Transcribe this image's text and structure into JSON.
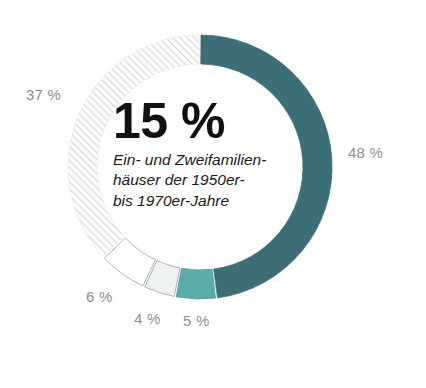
{
  "chart_data": {
    "type": "pie",
    "variant": "donut",
    "title": "",
    "subtitle": "",
    "xlabel": "",
    "ylabel": "",
    "unit": "%",
    "total": 100,
    "start_angle_deg": 0,
    "direction": "clockwise",
    "legend": "none",
    "grid": false,
    "center_value": "15 %",
    "center_caption_lines": [
      "Ein- und Zweifamilien-",
      "häuser der 1950er-",
      "bis 1970er-Jahre"
    ],
    "categories": [
      "48 %",
      "5 %",
      "4 %",
      "6 %",
      "37 %"
    ],
    "values": [
      48,
      5,
      4,
      6,
      37
    ],
    "labels": [
      "48 %",
      "5 %",
      "4 %",
      "6 %",
      "37 %"
    ],
    "slices": [
      {
        "label": "48 %",
        "value": 48,
        "color": "#3d6e75",
        "fill": "solid",
        "stroke": "#3d6e75"
      },
      {
        "label": "5 %",
        "value": 5,
        "color": "#5aada8",
        "fill": "solid",
        "stroke": "#4f9b97"
      },
      {
        "label": "4 %",
        "value": 4,
        "color": "#eef3f2",
        "fill": "solid",
        "stroke": "#9aa3a3"
      },
      {
        "label": "6 %",
        "value": 6,
        "color": "#ffffff",
        "fill": "solid",
        "stroke": "#9aa3a3"
      },
      {
        "label": "37 %",
        "value": 37,
        "color": "#d8dcdc",
        "fill": "hatch",
        "stroke": "#e2e6e6"
      }
    ]
  },
  "colors": {
    "primary_dark_teal": "#3d6e75",
    "accent_teal": "#5aada8",
    "off_white": "#eef3f2",
    "white": "#ffffff",
    "hatch_gray": "#d8dcdc",
    "label_gray": "#8e8e8e",
    "center_text": "#111111",
    "background": "#ffffff"
  },
  "center": {
    "value": "15 %",
    "line1": "Ein- und Zweifamilien-",
    "line2": "häuser der 1950er-",
    "line3": "bis 1970er-Jahre"
  },
  "labels": {
    "pct_37": "37 %",
    "pct_48": "48 %",
    "pct_6": "6 %",
    "pct_4": "4 %",
    "pct_5": "5 %"
  }
}
